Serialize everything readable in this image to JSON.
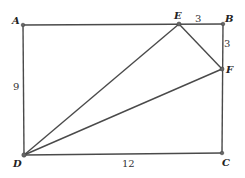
{
  "diagram": {
    "type": "geometry",
    "shape": "rectangle ABCD with segments DE, DF, EF",
    "points": {
      "A": {
        "label": "A",
        "x": 23,
        "y": 25
      },
      "B": {
        "label": "B",
        "x": 223,
        "y": 24
      },
      "C": {
        "label": "C",
        "x": 222,
        "y": 153
      },
      "D": {
        "label": "D",
        "x": 24,
        "y": 155
      },
      "E": {
        "label": "E",
        "x": 179,
        "y": 24
      },
      "F": {
        "label": "F",
        "x": 222,
        "y": 69
      }
    },
    "measurements": {
      "EB": "3",
      "BF": "3",
      "AD": "9",
      "DC": "12"
    }
  }
}
